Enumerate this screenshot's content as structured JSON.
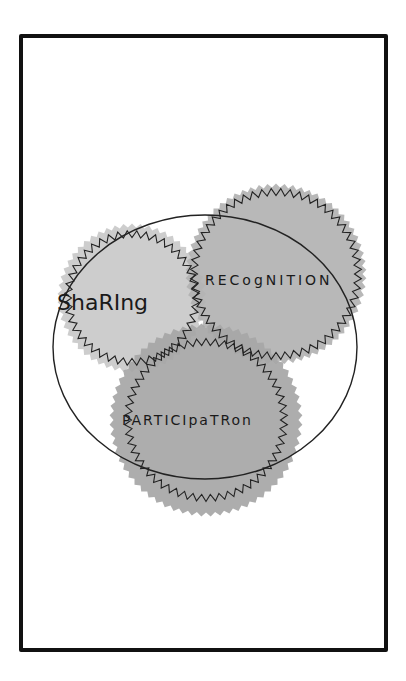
{
  "diagram": {
    "type": "venn",
    "frame": {
      "x": 21,
      "y": 36,
      "w": 365,
      "h": 614,
      "stroke": "#111111",
      "stroke_width": 4
    },
    "outer_ellipse": {
      "cx": 205,
      "cy": 347,
      "rx": 152,
      "ry": 132,
      "stroke": "#222222"
    },
    "sets": [
      {
        "id": "sharing",
        "label": "Sharing",
        "display_label": "ShaRIng",
        "cx": 132,
        "cy": 298,
        "r_fill": 72,
        "r_zig": 64,
        "teeth": 44,
        "fill": "#c9c9c9",
        "label_x": 57,
        "label_y": 310,
        "label_size": 22
      },
      {
        "id": "recognition",
        "label": "Recognition",
        "display_label": "RECogNITION",
        "cx": 276,
        "cy": 274,
        "r_fill": 88,
        "r_zig": 82,
        "teeth": 56,
        "fill": "#b2b2b2",
        "label_x": 205,
        "label_y": 285,
        "label_size": 14
      },
      {
        "id": "participation",
        "label": "Participation",
        "display_label": "PARTICIpaTRon",
        "cx": 206,
        "cy": 420,
        "r_fill": 94,
        "r_zig": 78,
        "teeth": 54,
        "fill": "#a6a6a6",
        "label_x": 122,
        "label_y": 425,
        "label_size": 14
      }
    ]
  }
}
